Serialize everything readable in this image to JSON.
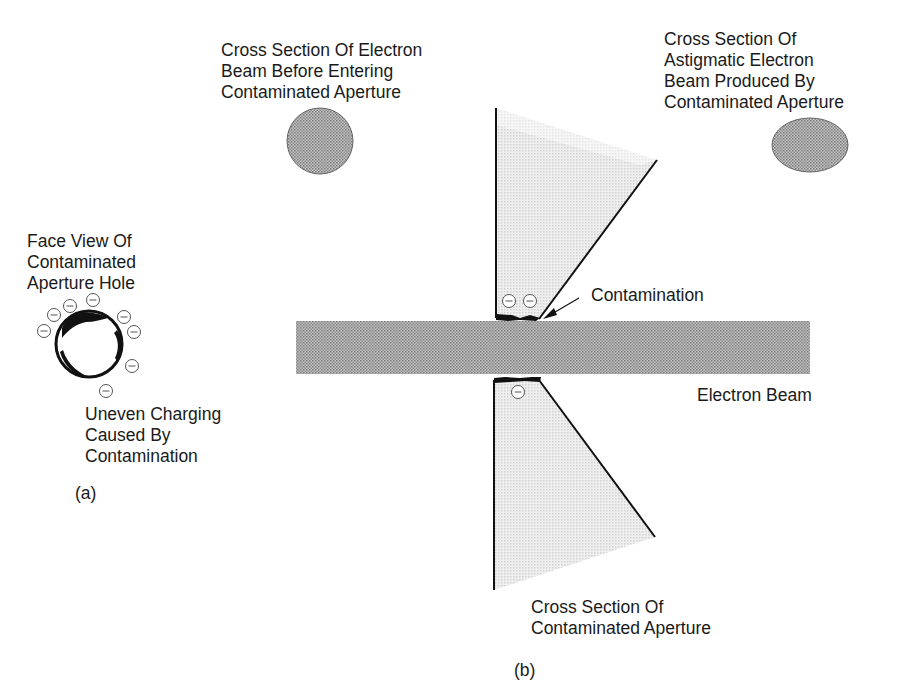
{
  "figure": {
    "panel_a": {
      "id_label": "(a)",
      "title_lines": [
        "Face View Of",
        "Contaminated",
        "Aperture Hole"
      ],
      "caption_lines": [
        "Uneven Charging",
        "Caused By",
        "Contamination"
      ],
      "charge_symbol": "⊖",
      "charge_count": 8
    },
    "panel_b": {
      "id_label": "(b)",
      "beam_before_label": [
        "Cross Section Of Electron",
        "Beam Before Entering",
        "Contaminated Aperture"
      ],
      "beam_after_label": [
        "Cross Section Of",
        "Astigmatic Electron",
        "Beam Produced By",
        "Contaminated Aperture"
      ],
      "contamination_label": "Contamination",
      "beam_label": "Electron Beam",
      "aperture_label": [
        "Cross Section Of",
        "Contaminated Aperture"
      ],
      "upper_charge_count": 2,
      "lower_charge_count": 1
    },
    "colors": {
      "ink": "#111111",
      "beam_fill": "#a8a8a8",
      "aperture_fill": "#e4e4e4",
      "text": "#1a1a1a"
    }
  }
}
